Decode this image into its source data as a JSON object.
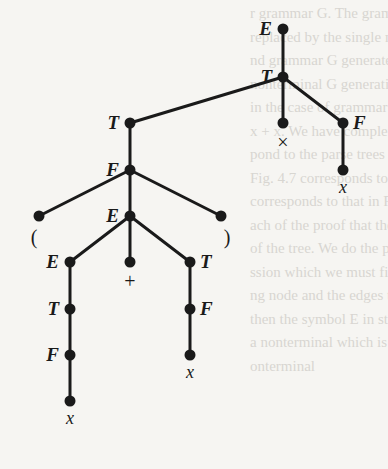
{
  "diagram": {
    "type": "parse-tree",
    "nodes": [
      {
        "id": "n1",
        "label": "E",
        "kind": "nonterminal",
        "x": 283,
        "y": 29,
        "label_side": "left"
      },
      {
        "id": "n2",
        "label": "T",
        "kind": "nonterminal",
        "x": 283,
        "y": 77,
        "label_side": "left"
      },
      {
        "id": "n3",
        "label": "T",
        "kind": "nonterminal",
        "x": 130,
        "y": 123,
        "label_side": "left"
      },
      {
        "id": "n4",
        "label": "×",
        "kind": "terminal",
        "x": 283,
        "y": 123,
        "label_side": "below"
      },
      {
        "id": "n5",
        "label": "F",
        "kind": "nonterminal",
        "x": 343,
        "y": 123,
        "label_side": "right"
      },
      {
        "id": "n6",
        "label": "x",
        "kind": "terminal",
        "x": 343,
        "y": 170,
        "label_side": "below"
      },
      {
        "id": "n7",
        "label": "F",
        "kind": "nonterminal",
        "x": 130,
        "y": 170,
        "label_side": "left"
      },
      {
        "id": "n8",
        "label": "(",
        "kind": "terminal",
        "x": 39,
        "y": 216,
        "label_side": "below-left"
      },
      {
        "id": "n9",
        "label": "E",
        "kind": "nonterminal",
        "x": 130,
        "y": 216,
        "label_side": "left"
      },
      {
        "id": "n10",
        "label": ")",
        "kind": "terminal",
        "x": 221,
        "y": 216,
        "label_side": "below-right"
      },
      {
        "id": "n11",
        "label": "E",
        "kind": "nonterminal",
        "x": 70,
        "y": 262,
        "label_side": "left"
      },
      {
        "id": "n12",
        "label": "+",
        "kind": "terminal",
        "x": 130,
        "y": 262,
        "label_side": "below"
      },
      {
        "id": "n13",
        "label": "T",
        "kind": "nonterminal",
        "x": 190,
        "y": 262,
        "label_side": "right"
      },
      {
        "id": "n14",
        "label": "T",
        "kind": "nonterminal",
        "x": 70,
        "y": 309,
        "label_side": "left"
      },
      {
        "id": "n15",
        "label": "F",
        "kind": "nonterminal",
        "x": 190,
        "y": 309,
        "label_side": "right"
      },
      {
        "id": "n16",
        "label": "F",
        "kind": "nonterminal",
        "x": 70,
        "y": 355,
        "label_side": "left"
      },
      {
        "id": "n17",
        "label": "x",
        "kind": "terminal",
        "x": 190,
        "y": 355,
        "label_side": "below"
      },
      {
        "id": "n18",
        "label": "x",
        "kind": "terminal",
        "x": 70,
        "y": 401,
        "label_side": "below"
      }
    ],
    "edges": [
      [
        "n1",
        "n2"
      ],
      [
        "n2",
        "n3"
      ],
      [
        "n2",
        "n4"
      ],
      [
        "n2",
        "n5"
      ],
      [
        "n5",
        "n6"
      ],
      [
        "n3",
        "n7"
      ],
      [
        "n7",
        "n8"
      ],
      [
        "n7",
        "n9"
      ],
      [
        "n7",
        "n10"
      ],
      [
        "n9",
        "n11"
      ],
      [
        "n9",
        "n12"
      ],
      [
        "n9",
        "n13"
      ],
      [
        "n11",
        "n14"
      ],
      [
        "n13",
        "n15"
      ],
      [
        "n14",
        "n16"
      ],
      [
        "n15",
        "n17"
      ],
      [
        "n16",
        "n18"
      ]
    ]
  },
  "background_bleed_lines": [
    "r grammar G. The grammatical syn",
    "replaced by the single nonterminal",
    "nd grammar G generate the same",
    "nonterminal G generating nodes of G",
    "in the case of grammar G, there",
    "x + x. We have completed the",
    "pond to the parse trees in Fig. 4.",
    "Fig. 4.7 corresponds to Fig. 4.",
    "corresponds to that in Fig. 4.",
    "ach of the proof that the correc",
    "of the tree. We do the proof b",
    "ssion which we must first explain",
    "ng node and the edges to only",
    "then the symbol E in string 4 in",
    "a nonterminal which is either E",
    "onterminal"
  ]
}
